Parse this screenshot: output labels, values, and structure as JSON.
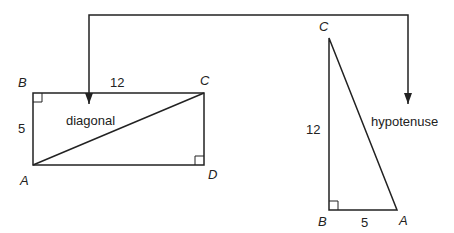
{
  "rectangle": {
    "vertices": {
      "A": "A",
      "B": "B",
      "C": "C",
      "D": "D"
    },
    "side_top": "12",
    "side_left": "5",
    "diagonal_label": "diagonal"
  },
  "triangle": {
    "vertices": {
      "A": "A",
      "B": "B",
      "C": "C"
    },
    "side_vertical": "12",
    "side_bottom": "5",
    "hypotenuse_label": "hypotenuse"
  },
  "colors": {
    "stroke": "#222222",
    "background": "#ffffff"
  }
}
